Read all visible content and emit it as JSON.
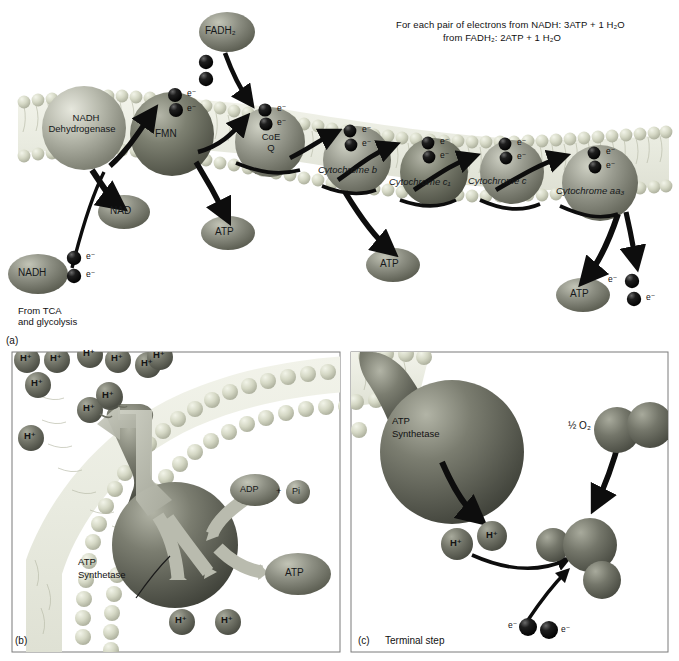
{
  "figure": {
    "equation_line1": "For each pair of electrons from NADH: 3ATP  +  1 H₂O",
    "equation_line2": "from FADH₂: 2ATP  +  1 H₂O"
  },
  "panel_a": {
    "caption": "(a)",
    "source_note_line1": "From TCA",
    "source_note_line2": "and glycolysis",
    "carriers": [
      {
        "id": "nadh-dehydrogenase",
        "label_line1": "NADH",
        "label_line2": "Dehydrogenase",
        "color": "#a6a79a",
        "text_color": "#1a1c1a"
      },
      {
        "id": "fmn",
        "label_line1": "FMN",
        "label_line2": "",
        "color": "#7d8071",
        "text_color": "#1a1c1a"
      },
      {
        "id": "coe-q",
        "label_line1": "CoE",
        "label_line2": "Q",
        "color": "#9a9c90",
        "text_color": "#1a1c1a"
      },
      {
        "id": "cytochrome-b",
        "label_line1": "Cytochrome b",
        "label_line2": "",
        "color": "#8e9085",
        "text_color": "#15181a"
      },
      {
        "id": "cytochrome-c1",
        "label_line1": "Cytochrome c₁",
        "label_line2": "",
        "color": "#7a7d70",
        "text_color": "#15181a"
      },
      {
        "id": "cytochrome-c",
        "label_line1": "Cytochrome c",
        "label_line2": "",
        "color": "#93958a",
        "text_color": "#15181a"
      },
      {
        "id": "cytochrome-aa3",
        "label_line1": "Cytochrome aa₃",
        "label_line2": "",
        "color": "#8a8c80",
        "text_color": "#15181a"
      }
    ],
    "substrates": [
      {
        "id": "fadh2",
        "label": "FADH₂"
      },
      {
        "id": "nadh",
        "label": "NADH"
      },
      {
        "id": "nad",
        "label": "NAD"
      }
    ],
    "atp_outputs": [
      {
        "id": "atp-1",
        "label": "ATP"
      },
      {
        "id": "atp-2",
        "label": "ATP"
      },
      {
        "id": "atp-3",
        "label": "ATP"
      }
    ],
    "electron_label": "e⁻",
    "electron_pair_count": 2
  },
  "panel_b": {
    "caption": "(b)",
    "enzyme_line1": "ATP",
    "enzyme_line2": "Synthetase",
    "proton_label": "H⁺",
    "proton_count_outer": 11,
    "proton_count_inner": 2,
    "adp_label": "ADP",
    "plus_label": "+",
    "pi_label": "Pi",
    "atp_label": "ATP"
  },
  "panel_c": {
    "caption": "(c)",
    "caption_text": "Terminal step",
    "enzyme_line1": "ATP",
    "enzyme_line2": "Synthetase",
    "oxygen_label": "½ O₂",
    "proton_label": "H⁺",
    "proton_count": 2,
    "electron_label": "e⁻",
    "electron_count": 2
  },
  "colors": {
    "membrane_head": "#d8dbc8",
    "membrane_head_dark": "#b9bda8",
    "membrane_fill": "#eef0e6",
    "sphere_dark": "#5f6155",
    "sphere_mid": "#8a8c80",
    "sphere_light": "#b6b8ab",
    "proton": "#6d6f62",
    "electron": "#121212",
    "arrow_black": "#0d0d0d",
    "arrow_gray": "#b9bbae",
    "panel_border": "#7b7b7b",
    "background": "#ffffff"
  }
}
